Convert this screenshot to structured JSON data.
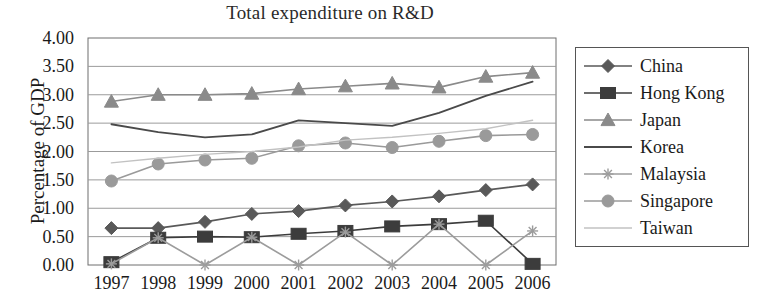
{
  "chart_data": {
    "type": "line",
    "title": "Total expenditure on R&D",
    "xlabel": "",
    "ylabel": "Percentage of GDP",
    "categories": [
      "1997",
      "1998",
      "1999",
      "2000",
      "2001",
      "2002",
      "2003",
      "2004",
      "2005",
      "2006"
    ],
    "x": [
      1997,
      1998,
      1999,
      2000,
      2001,
      2002,
      2003,
      2004,
      2005,
      2006
    ],
    "ylim": [
      0.0,
      4.0
    ],
    "y_ticks": [
      "0.00",
      "0.50",
      "1.00",
      "1.50",
      "2.00",
      "2.50",
      "3.00",
      "3.50",
      "4.00"
    ],
    "y_tick_values": [
      0.0,
      0.5,
      1.0,
      1.5,
      2.0,
      2.5,
      3.0,
      3.5,
      4.0
    ],
    "grid": true,
    "legend_position": "right",
    "series": [
      {
        "name": "China",
        "marker": "diamond",
        "color": "#595959",
        "values": [
          0.65,
          0.65,
          0.76,
          0.9,
          0.95,
          1.05,
          1.12,
          1.21,
          1.32,
          1.42
        ]
      },
      {
        "name": "Hong Kong",
        "marker": "square",
        "color": "#3c3c3c",
        "values": [
          0.05,
          0.48,
          0.5,
          0.49,
          0.55,
          0.6,
          0.68,
          0.72,
          0.78,
          0.02
        ]
      },
      {
        "name": "Japan",
        "marker": "triangle",
        "color": "#8a8a8a",
        "values": [
          2.88,
          3.0,
          3.0,
          3.02,
          3.1,
          3.15,
          3.2,
          3.13,
          3.32,
          3.39
        ]
      },
      {
        "name": "Korea",
        "marker": "none",
        "color": "#4a4a4a",
        "values": [
          2.48,
          2.34,
          2.25,
          2.3,
          2.55,
          2.5,
          2.45,
          2.68,
          2.98,
          3.23
        ]
      },
      {
        "name": "Malaysia",
        "marker": "star",
        "color": "#9c9c9c",
        "values": [
          0.02,
          0.48,
          0.0,
          0.49,
          0.0,
          0.58,
          0.0,
          0.72,
          0.0,
          0.6
        ]
      },
      {
        "name": "Singapore",
        "marker": "circle",
        "color": "#9a9a9a",
        "values": [
          1.48,
          1.78,
          1.85,
          1.88,
          2.1,
          2.15,
          2.07,
          2.18,
          2.28,
          2.3
        ]
      },
      {
        "name": "Taiwan",
        "marker": "none",
        "color": "#c2c2c2",
        "values": [
          1.8,
          1.88,
          1.95,
          2.0,
          2.08,
          2.2,
          2.25,
          2.32,
          2.4,
          2.55
        ]
      }
    ]
  },
  "axes": {
    "plot_left": 88,
    "plot_right": 556,
    "plot_top": 38,
    "plot_bottom": 265
  },
  "legend": {
    "items": [
      {
        "label": "China"
      },
      {
        "label": "Hong Kong"
      },
      {
        "label": "Japan"
      },
      {
        "label": "Korea"
      },
      {
        "label": "Malaysia"
      },
      {
        "label": "Singapore"
      },
      {
        "label": "Taiwan"
      }
    ]
  }
}
